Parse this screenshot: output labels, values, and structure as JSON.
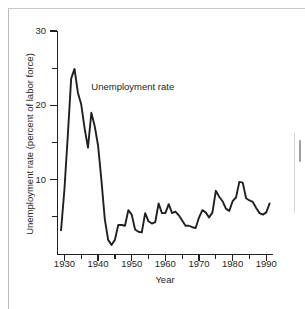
{
  "figure": {
    "annotation": "Unemployment rate",
    "line_color": "#231f20",
    "axis_color": "#231f20"
  },
  "chart_data": {
    "type": "line",
    "title": "",
    "xlabel": "Year",
    "ylabel": "Unemployment rate (percent of labor force)",
    "xlim": [
      1928,
      1992
    ],
    "ylim": [
      0,
      30
    ],
    "grid": false,
    "legend": false,
    "annotations": [
      {
        "text": "Unemployment rate",
        "x": 1938,
        "y": 22.5
      }
    ],
    "xticks": [
      1930,
      1940,
      1950,
      1960,
      1970,
      1980,
      1990
    ],
    "xticklabels": [
      "1930",
      "1940",
      "1950",
      "1960",
      "1970",
      "1980",
      "1990"
    ],
    "xticks_minor": [
      1935,
      1945,
      1955,
      1965,
      1975,
      1985
    ],
    "yticks": [
      10,
      20,
      30
    ],
    "yticklabels": [
      "10",
      "20",
      "30"
    ],
    "yticks_minor": [
      5,
      15,
      25
    ],
    "series": [
      {
        "name": "Unemployment rate",
        "x": [
          1929,
          1930,
          1931,
          1932,
          1933,
          1934,
          1935,
          1936,
          1937,
          1938,
          1939,
          1940,
          1941,
          1942,
          1943,
          1944,
          1945,
          1946,
          1947,
          1948,
          1949,
          1950,
          1951,
          1952,
          1953,
          1954,
          1955,
          1956,
          1957,
          1958,
          1959,
          1960,
          1961,
          1962,
          1963,
          1964,
          1965,
          1966,
          1967,
          1968,
          1969,
          1970,
          1971,
          1972,
          1973,
          1974,
          1975,
          1976,
          1977,
          1978,
          1979,
          1980,
          1981,
          1982,
          1983,
          1984,
          1985,
          1986,
          1987,
          1988,
          1989,
          1990,
          1991
        ],
        "values": [
          3.2,
          8.7,
          15.9,
          23.6,
          24.9,
          21.7,
          20.1,
          16.9,
          14.3,
          19.0,
          17.2,
          14.6,
          9.9,
          4.7,
          1.9,
          1.2,
          1.9,
          3.9,
          3.9,
          3.8,
          5.9,
          5.3,
          3.3,
          3.0,
          2.9,
          5.5,
          4.4,
          4.1,
          4.3,
          6.8,
          5.5,
          5.5,
          6.7,
          5.5,
          5.7,
          5.2,
          4.5,
          3.8,
          3.8,
          3.6,
          3.5,
          4.9,
          5.9,
          5.6,
          4.9,
          5.6,
          8.5,
          7.7,
          7.1,
          6.1,
          5.8,
          7.1,
          7.6,
          9.7,
          9.6,
          7.5,
          7.2,
          7.0,
          6.2,
          5.5,
          5.3,
          5.6,
          6.8
        ]
      }
    ]
  }
}
